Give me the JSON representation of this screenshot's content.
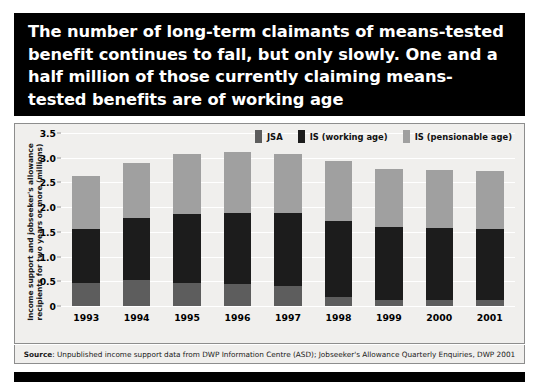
{
  "title": {
    "text": "The number of long-term claimants of means-tested benefit continues to fall, but only slowly. One and a half million of those currently claiming means-tested benefits are of working age"
  },
  "source": {
    "label": "Source",
    "text": ": Unpublished income support data from DWP Information Centre (ASD); Jobseeker's Allowance Quarterly Enquiries, DWP 2001"
  },
  "colors": {
    "jsa": "#5d5d5d",
    "is_working_age": "#1c1c1c",
    "is_pensionable_age": "#a0a0a0",
    "panel_background": "#f0efed",
    "banner_background": "#000000",
    "gridline": "#ffffff"
  },
  "chart_data": {
    "type": "bar",
    "stacked": true,
    "title": "",
    "xlabel": "",
    "ylabel": "Income support and jobseeker's allowance recipients for two years or more (millions)",
    "categories": [
      "1993",
      "1994",
      "1995",
      "1996",
      "1997",
      "1998",
      "1999",
      "2000",
      "2001"
    ],
    "ylim": [
      0,
      3.5
    ],
    "yticks": [
      0,
      0.5,
      1.0,
      1.5,
      2.0,
      2.5,
      3.0,
      3.5
    ],
    "ytick_labels": [
      "0",
      "0.5",
      "1.0",
      "1.5",
      "2.0",
      "2.5",
      "3.0",
      "3.5"
    ],
    "grid": true,
    "legend_position": "top-right",
    "series": [
      {
        "name": "JSA",
        "color": "#5d5d5d",
        "values": [
          0.47,
          0.53,
          0.47,
          0.44,
          0.41,
          0.18,
          0.13,
          0.13,
          0.12
        ]
      },
      {
        "name": "IS (working age)",
        "color": "#1c1c1c",
        "values": [
          1.09,
          1.26,
          1.4,
          1.45,
          1.47,
          1.55,
          1.47,
          1.44,
          1.43
        ]
      },
      {
        "name": "IS (pensionable age)",
        "color": "#a0a0a0",
        "values": [
          1.07,
          1.11,
          1.2,
          1.23,
          1.2,
          1.2,
          1.18,
          1.19,
          1.18
        ]
      }
    ],
    "totals": [
      2.63,
      2.9,
      3.07,
      3.12,
      3.08,
      2.93,
      2.78,
      2.76,
      2.73
    ]
  }
}
